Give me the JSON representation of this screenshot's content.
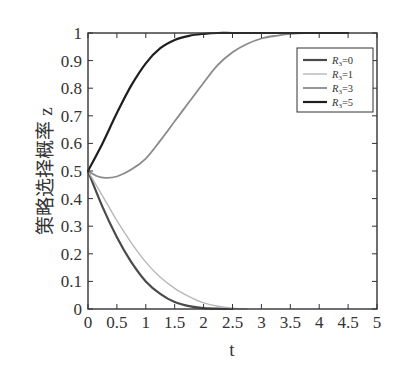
{
  "chart_data": {
    "type": "line",
    "title": "",
    "xlabel": "t",
    "ylabel": "策略选择概率 z",
    "xlim": [
      0,
      5
    ],
    "ylim": [
      0,
      1
    ],
    "xticks": [
      "0",
      "0.5",
      "1",
      "1.5",
      "2",
      "2.5",
      "3",
      "3.5",
      "4",
      "4.5",
      "5"
    ],
    "yticks": [
      "0",
      "0.1",
      "0.2",
      "0.3",
      "0.4",
      "0.5",
      "0.6",
      "0.7",
      "0.8",
      "0.9",
      "1"
    ],
    "grid": false,
    "legend_position": "upper right",
    "series": [
      {
        "name": "R3=0",
        "legend_var": "R",
        "legend_sub": "3",
        "legend_val": "=0",
        "color": "#4a4a4a",
        "width": 2.2,
        "x": [
          0,
          0.25,
          0.5,
          0.75,
          1.0,
          1.25,
          1.5,
          1.75,
          2.0,
          2.25,
          2.5
        ],
        "y": [
          0.5,
          0.37,
          0.26,
          0.17,
          0.1,
          0.055,
          0.025,
          0.01,
          0.003,
          0.001,
          0
        ]
      },
      {
        "name": "R3=1",
        "legend_var": "R",
        "legend_sub": "3",
        "legend_val": "=1",
        "color": "#b8b8b8",
        "width": 1.4,
        "x": [
          0,
          0.25,
          0.5,
          0.75,
          1.0,
          1.25,
          1.5,
          1.75,
          2.0,
          2.25,
          2.5,
          2.75
        ],
        "y": [
          0.5,
          0.41,
          0.32,
          0.24,
          0.17,
          0.115,
          0.075,
          0.045,
          0.022,
          0.01,
          0.003,
          0
        ]
      },
      {
        "name": "R3=3",
        "legend_var": "R",
        "legend_sub": "3",
        "legend_val": "=3",
        "color": "#8a8a8a",
        "width": 1.8,
        "x": [
          0,
          0.15,
          0.3,
          0.5,
          0.75,
          1.0,
          1.25,
          1.5,
          1.75,
          2.0,
          2.25,
          2.5,
          2.75,
          3.0,
          3.25,
          3.5,
          3.75,
          4.0,
          4.5
        ],
        "y": [
          0.5,
          0.482,
          0.475,
          0.48,
          0.505,
          0.545,
          0.61,
          0.68,
          0.75,
          0.82,
          0.885,
          0.93,
          0.96,
          0.98,
          0.99,
          0.997,
          1.0,
          1.0,
          1.0
        ]
      },
      {
        "name": "R3=5",
        "legend_var": "R",
        "legend_sub": "3",
        "legend_val": "=5",
        "color": "#1e1e1e",
        "width": 2.2,
        "x": [
          0,
          0.25,
          0.5,
          0.75,
          1.0,
          1.25,
          1.5,
          1.75,
          2.0,
          2.25,
          2.5,
          3.0,
          3.5,
          4.0,
          4.5
        ],
        "y": [
          0.5,
          0.6,
          0.71,
          0.81,
          0.89,
          0.945,
          0.975,
          0.99,
          0.997,
          1.0,
          1.0,
          1.0,
          1.0,
          1.0,
          1.0
        ]
      }
    ]
  }
}
